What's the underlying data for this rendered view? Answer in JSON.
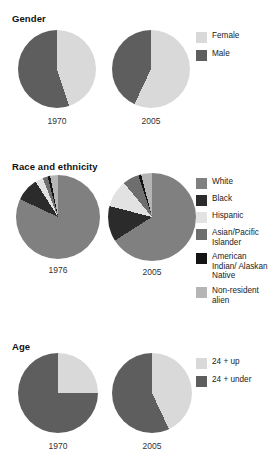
{
  "chart_data": [
    {
      "type": "pie",
      "title": "Gender",
      "legend_position": "right",
      "legend": [
        "Female",
        "Male"
      ],
      "colors": [
        "#d9d9d9",
        "#5e5e5e"
      ],
      "charts": [
        {
          "label": "1970",
          "categories": [
            "Female",
            "Male"
          ],
          "values": [
            45,
            55
          ]
        },
        {
          "label": "2005",
          "categories": [
            "Female",
            "Male"
          ],
          "values": [
            57,
            43
          ]
        }
      ]
    },
    {
      "type": "pie",
      "title": "Race and ethnicity",
      "legend_position": "right",
      "legend": [
        "White",
        "Black",
        "Hispanic",
        "Asian/Pacific Islander",
        "American Indian/ Alaskan Native",
        "Non-resident alien"
      ],
      "colors": [
        "#808080",
        "#2b2b2b",
        "#e2e2e2",
        "#6e6e6e",
        "#141414",
        "#b5b5b5"
      ],
      "charts": [
        {
          "label": "1976",
          "categories": [
            "White",
            "Black",
            "Hispanic",
            "Asian/Pacific Islander",
            "American Indian/Alaskan Native",
            "Non-resident alien"
          ],
          "values": [
            82,
            9,
            3,
            2,
            1,
            3
          ]
        },
        {
          "label": "2005",
          "categories": [
            "White",
            "Black",
            "Hispanic",
            "Asian/Pacific Islander",
            "American Indian/Alaskan Native",
            "Non-resident alien"
          ],
          "values": [
            66,
            13,
            10,
            6,
            1,
            4
          ]
        }
      ]
    },
    {
      "type": "pie",
      "title": "Age",
      "legend_position": "right",
      "legend": [
        "24 + up",
        "24 + under"
      ],
      "colors": [
        "#d9d9d9",
        "#5e5e5e"
      ],
      "charts": [
        {
          "label": "1970",
          "categories": [
            "24 + up",
            "24 + under"
          ],
          "values": [
            25,
            75
          ]
        },
        {
          "label": "2005",
          "categories": [
            "24 + up",
            "24 + under"
          ],
          "values": [
            43,
            57
          ]
        }
      ]
    }
  ],
  "gender": {
    "title": "Gender",
    "legend": [
      {
        "label": "Female",
        "color": "#d9d9d9"
      },
      {
        "label": "Male",
        "color": "#5e5e5e"
      }
    ],
    "pies": [
      {
        "year": "1970"
      },
      {
        "year": "2005"
      }
    ]
  },
  "race": {
    "title": "Race and ethnicity",
    "legend": [
      {
        "label": "White",
        "color": "#808080"
      },
      {
        "label": "Black",
        "color": "#2b2b2b"
      },
      {
        "label": "Hispanic",
        "color": "#e2e2e2"
      },
      {
        "label": "Asian/Pacific Islander",
        "color": "#6e6e6e"
      },
      {
        "label": "American Indian/ Alaskan Native",
        "color": "#141414"
      },
      {
        "label": "Non-resident alien",
        "color": "#b5b5b5"
      }
    ],
    "pies": [
      {
        "year": "1976"
      },
      {
        "year": "2005"
      }
    ]
  },
  "age": {
    "title": "Age",
    "legend": [
      {
        "label": "24 + up",
        "color": "#d9d9d9"
      },
      {
        "label": "24 + under",
        "color": "#5e5e5e"
      }
    ],
    "pies": [
      {
        "year": "1970"
      },
      {
        "year": "2005"
      }
    ]
  }
}
